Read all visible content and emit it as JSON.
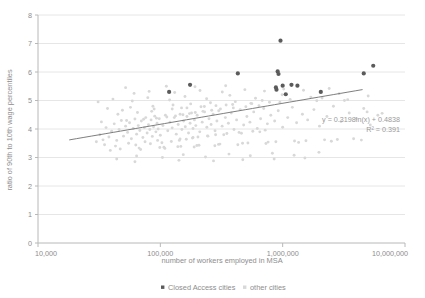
{
  "chart_data": {
    "type": "scatter",
    "title": "",
    "xlabel": "number of workers employed in MSA",
    "ylabel": "ratio of 90th to 10th wage percentiles",
    "xscale": "log",
    "xlim": [
      10000,
      10000000
    ],
    "ylim": [
      0,
      8
    ],
    "xticks": [
      10000,
      100000,
      1000000,
      10000000
    ],
    "xticklabels": [
      "10,000",
      "100,000",
      "1,000,000",
      "10,000,000"
    ],
    "yticks": [
      0,
      1,
      2,
      3,
      4,
      5,
      6,
      7,
      8
    ],
    "yticklabels": [
      "0",
      "1",
      "2",
      "3",
      "4",
      "5",
      "6",
      "7",
      "8"
    ],
    "grid": "horizontal",
    "legend_position": "bottom-center",
    "legend": [
      {
        "label": "Closed Access cities",
        "marker": "square",
        "color": "#5b5b5b"
      },
      {
        "label": "other cities",
        "marker": "square",
        "color": "#d8d8d8"
      }
    ],
    "annotations": [
      {
        "text_equation": "y = 0.3198ln(x) + 0.4838",
        "text_r2": "R² = 0.391"
      }
    ],
    "trendline": {
      "equation": "y = 0.3198ln(x) + 0.4838",
      "r_squared": 0.391,
      "slope_coefficient": 0.3198,
      "intercept": 0.4838,
      "x_start": 18000,
      "x_end": 4500000
    },
    "series": [
      {
        "name": "Closed Access cities",
        "color": "#5b5b5b",
        "points": [
          [
            118000,
            5.3
          ],
          [
            175000,
            5.55
          ],
          [
            430000,
            5.95
          ],
          [
            960000,
            7.1
          ],
          [
            910000,
            6.02
          ],
          [
            925000,
            5.93
          ],
          [
            880000,
            5.46
          ],
          [
            890000,
            5.38
          ],
          [
            1000000,
            5.52
          ],
          [
            1060000,
            5.22
          ],
          [
            1180000,
            5.55
          ],
          [
            1320000,
            5.52
          ],
          [
            2050000,
            5.3
          ],
          [
            4600000,
            5.95
          ],
          [
            5500000,
            6.22
          ]
        ]
      },
      {
        "name": "other cities",
        "color": "#d8d8d8",
        "points": [
          [
            30000,
            3.55
          ],
          [
            32000,
            3.8
          ],
          [
            34000,
            3.62
          ],
          [
            36000,
            4.05
          ],
          [
            38000,
            3.72
          ],
          [
            40000,
            3.92
          ],
          [
            42000,
            4.18
          ],
          [
            44000,
            3.6
          ],
          [
            46000,
            3.98
          ],
          [
            48000,
            4.3
          ],
          [
            50000,
            3.75
          ],
          [
            52000,
            4.1
          ],
          [
            54000,
            3.88
          ],
          [
            56000,
            4.22
          ],
          [
            58000,
            3.66
          ],
          [
            60000,
            4.02
          ],
          [
            62000,
            4.35
          ],
          [
            64000,
            3.82
          ],
          [
            66000,
            4.12
          ],
          [
            68000,
            3.95
          ],
          [
            70000,
            4.28
          ],
          [
            72000,
            3.7
          ],
          [
            74000,
            4.05
          ],
          [
            76000,
            4.4
          ],
          [
            78000,
            3.86
          ],
          [
            80000,
            4.15
          ],
          [
            82000,
            3.98
          ],
          [
            84000,
            4.32
          ],
          [
            86000,
            3.74
          ],
          [
            88000,
            4.08
          ],
          [
            90000,
            4.45
          ],
          [
            92000,
            3.9
          ],
          [
            94000,
            4.2
          ],
          [
            96000,
            4.0
          ],
          [
            98000,
            4.36
          ],
          [
            100000,
            3.78
          ],
          [
            105000,
            4.12
          ],
          [
            110000,
            4.48
          ],
          [
            115000,
            3.94
          ],
          [
            120000,
            4.24
          ],
          [
            125000,
            4.04
          ],
          [
            130000,
            4.4
          ],
          [
            135000,
            3.82
          ],
          [
            140000,
            4.16
          ],
          [
            145000,
            4.52
          ],
          [
            150000,
            3.98
          ],
          [
            155000,
            4.28
          ],
          [
            160000,
            4.08
          ],
          [
            165000,
            4.44
          ],
          [
            170000,
            3.86
          ],
          [
            175000,
            4.2
          ],
          [
            180000,
            4.56
          ],
          [
            185000,
            4.02
          ],
          [
            190000,
            4.32
          ],
          [
            195000,
            4.12
          ],
          [
            200000,
            4.48
          ],
          [
            210000,
            3.9
          ],
          [
            220000,
            4.24
          ],
          [
            230000,
            4.6
          ],
          [
            240000,
            4.06
          ],
          [
            250000,
            4.36
          ],
          [
            260000,
            4.16
          ],
          [
            270000,
            4.52
          ],
          [
            280000,
            3.94
          ],
          [
            290000,
            4.28
          ],
          [
            300000,
            4.64
          ],
          [
            320000,
            4.1
          ],
          [
            340000,
            4.4
          ],
          [
            360000,
            4.2
          ],
          [
            380000,
            4.56
          ],
          [
            400000,
            3.98
          ],
          [
            420000,
            4.32
          ],
          [
            450000,
            4.68
          ],
          [
            480000,
            4.14
          ],
          [
            510000,
            4.44
          ],
          [
            540000,
            4.24
          ],
          [
            580000,
            4.6
          ],
          [
            620000,
            4.02
          ],
          [
            660000,
            4.36
          ],
          [
            700000,
            4.72
          ],
          [
            750000,
            4.18
          ],
          [
            800000,
            4.48
          ],
          [
            860000,
            4.28
          ],
          [
            920000,
            4.64
          ],
          [
            1000000,
            4.06
          ],
          [
            1100000,
            4.4
          ],
          [
            1200000,
            4.76
          ],
          [
            1300000,
            4.22
          ],
          [
            1450000,
            4.52
          ],
          [
            1600000,
            4.32
          ],
          [
            1800000,
            4.68
          ],
          [
            2000000,
            4.1
          ],
          [
            2300000,
            4.44
          ],
          [
            2600000,
            4.8
          ],
          [
            3000000,
            4.26
          ],
          [
            3500000,
            4.56
          ],
          [
            4000000,
            4.36
          ],
          [
            4600000,
            4.72
          ],
          [
            5200000,
            4.14
          ],
          [
            6000000,
            4.48
          ],
          [
            35000,
            3.45
          ],
          [
            45000,
            4.52
          ],
          [
            55000,
            3.5
          ],
          [
            65000,
            4.58
          ],
          [
            75000,
            3.55
          ],
          [
            85000,
            4.62
          ],
          [
            95000,
            3.6
          ],
          [
            125000,
            4.7
          ],
          [
            145000,
            3.65
          ],
          [
            165000,
            4.74
          ],
          [
            185000,
            3.7
          ],
          [
            215000,
            4.78
          ],
          [
            245000,
            3.75
          ],
          [
            285000,
            4.82
          ],
          [
            330000,
            3.8
          ],
          [
            390000,
            4.86
          ],
          [
            460000,
            3.85
          ],
          [
            550000,
            4.9
          ],
          [
            650000,
            3.9
          ],
          [
            780000,
            4.94
          ],
          [
            33000,
            4.25
          ],
          [
            43000,
            3.4
          ],
          [
            53000,
            4.3
          ],
          [
            63000,
            3.44
          ],
          [
            73000,
            4.34
          ],
          [
            83000,
            3.48
          ],
          [
            93000,
            4.38
          ],
          [
            103000,
            3.52
          ],
          [
            113000,
            4.42
          ],
          [
            123000,
            3.56
          ],
          [
            133000,
            4.46
          ],
          [
            143000,
            3.6
          ],
          [
            153000,
            4.5
          ],
          [
            163000,
            3.64
          ],
          [
            173000,
            4.54
          ],
          [
            183000,
            3.68
          ],
          [
            193000,
            4.58
          ],
          [
            203000,
            3.72
          ],
          [
            223000,
            4.62
          ],
          [
            243000,
            3.76
          ],
          [
            263000,
            4.66
          ],
          [
            283000,
            3.8
          ],
          [
            310000,
            4.7
          ],
          [
            350000,
            3.84
          ],
          [
            395000,
            4.74
          ],
          [
            440000,
            3.88
          ],
          [
            500000,
            4.78
          ],
          [
            570000,
            3.92
          ],
          [
            640000,
            4.82
          ],
          [
            720000,
            3.96
          ],
          [
            31000,
            4.95
          ],
          [
            41000,
            5.05
          ],
          [
            59000,
            4.98
          ],
          [
            79000,
            5.1
          ],
          [
            99000,
            3.35
          ],
          [
            119000,
            5.02
          ],
          [
            139000,
            3.38
          ],
          [
            159000,
            5.14
          ],
          [
            199000,
            3.42
          ],
          [
            239000,
            5.06
          ],
          [
            299000,
            3.46
          ],
          [
            370000,
            5.18
          ],
          [
            470000,
            3.5
          ],
          [
            600000,
            5.08
          ],
          [
            760000,
            3.54
          ],
          [
            990000,
            5.2
          ],
          [
            1250000,
            3.58
          ],
          [
            1700000,
            5.12
          ],
          [
            2200000,
            3.62
          ],
          [
            2900000,
            5.24
          ],
          [
            3800000,
            3.66
          ],
          [
            5000000,
            5.16
          ],
          [
            37000,
            4.72
          ],
          [
            47000,
            3.3
          ],
          [
            57000,
            4.76
          ],
          [
            67000,
            3.33
          ],
          [
            87000,
            4.8
          ],
          [
            107000,
            3.36
          ],
          [
            127000,
            4.84
          ],
          [
            147000,
            3.39
          ],
          [
            177000,
            4.88
          ],
          [
            207000,
            3.43
          ],
          [
            257000,
            4.92
          ],
          [
            307000,
            3.47
          ],
          [
            410000,
            4.96
          ],
          [
            520000,
            3.51
          ],
          [
            680000,
            5.0
          ],
          [
            880000,
            3.55
          ],
          [
            1150000,
            5.04
          ],
          [
            1550000,
            3.59
          ],
          [
            2100000,
            5.09
          ],
          [
            2800000,
            3.63
          ],
          [
            39000,
            3.25
          ],
          [
            49000,
            4.66
          ],
          [
            69000,
            3.28
          ],
          [
            89000,
            4.7
          ],
          [
            109000,
            3.32
          ],
          [
            149000,
            4.74
          ],
          [
            189000,
            3.37
          ],
          [
            229000,
            4.79
          ],
          [
            279000,
            3.41
          ],
          [
            345000,
            4.84
          ],
          [
            430000,
            3.45
          ],
          [
            560000,
            4.89
          ],
          [
            730000,
            3.49
          ],
          [
            950000,
            4.94
          ],
          [
            1350000,
            3.53
          ],
          [
            1900000,
            4.99
          ],
          [
            2500000,
            3.57
          ],
          [
            3400000,
            5.03
          ],
          [
            4400000,
            3.61
          ],
          [
            6500000,
            4.55
          ],
          [
            61000,
            5.25
          ],
          [
            81000,
            5.32
          ],
          [
            131000,
            5.28
          ],
          [
            211000,
            5.35
          ],
          [
            321000,
            5.3
          ],
          [
            491000,
            5.38
          ],
          [
            710000,
            5.33
          ],
          [
            1020000,
            5.4
          ],
          [
            1480000,
            5.36
          ],
          [
            2400000,
            5.42
          ],
          [
            3200000,
            5.0
          ],
          [
            4900000,
            4.6
          ],
          [
            44000,
            2.95
          ],
          [
            64000,
            3.05
          ],
          [
            104000,
            3.0
          ],
          [
            154000,
            3.1
          ],
          [
            234000,
            3.02
          ],
          [
            364000,
            3.12
          ],
          [
            544000,
            3.06
          ],
          [
            824000,
            3.15
          ],
          [
            1240000,
            3.08
          ],
          [
            1980000,
            3.18
          ],
          [
            52000,
            5.45
          ],
          [
            112000,
            5.5
          ],
          [
            192000,
            5.48
          ],
          [
            342000,
            5.52
          ],
          [
            62000,
            2.85
          ],
          [
            142000,
            2.9
          ],
          [
            272000,
            2.88
          ],
          [
            472000,
            2.92
          ],
          [
            852000,
            2.95
          ],
          [
            1520000,
            2.98
          ]
        ]
      }
    ]
  },
  "legend": {
    "closed_label": "Closed Access cities",
    "other_label": "other cities"
  },
  "axes": {
    "x_title": "number of workers employed in MSA",
    "y_title": "ratio of 90th to 10th wage percentiles"
  },
  "annotation": {
    "equation": "y = 0.3198ln(x) + 0.4838",
    "r_squared": "R² = 0.391"
  }
}
